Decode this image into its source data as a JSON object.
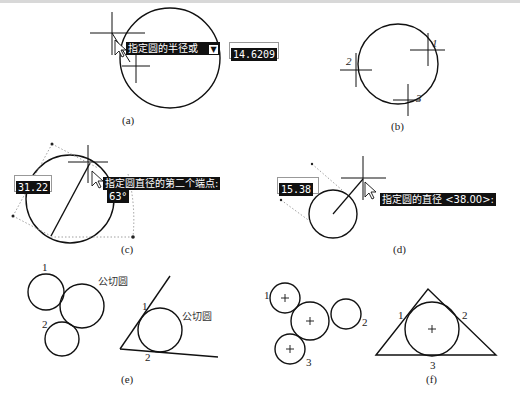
{
  "figure": {
    "panels": {
      "a": {
        "caption": "(a)",
        "tooltip": "指定圆的半径或",
        "tooltip_icon": "down-arrow-icon",
        "input_value": "14.6209"
      },
      "b": {
        "caption": "(b)",
        "point_labels": [
          "1",
          "2",
          "3"
        ]
      },
      "c": {
        "caption": "(c)",
        "input_value": "31.22",
        "tooltip": "指定圆直径的第二个端点:",
        "angle_value": "63°"
      },
      "d": {
        "caption": "(d)",
        "input_value": "15.38",
        "tooltip": "指定圆的直径 <38.00>:"
      },
      "e": {
        "caption": "(e)",
        "left": {
          "label_1": "1",
          "label_2": "2",
          "tangent_label": "公切圆"
        },
        "right": {
          "label_1": "1",
          "label_2": "2",
          "tangent_label": "公切圆"
        }
      },
      "f": {
        "caption": "(f)",
        "left": {
          "label_1": "1",
          "label_2": "2",
          "label_3": "3"
        },
        "right": {
          "label_1": "1",
          "label_2": "2",
          "label_3": "3"
        }
      }
    }
  }
}
